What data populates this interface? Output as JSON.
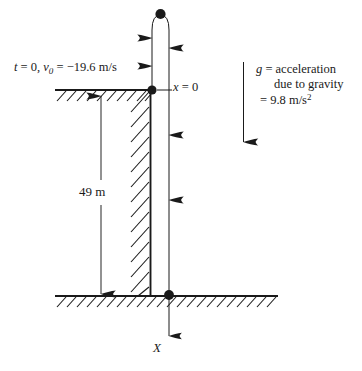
{
  "figure": {
    "background_color": "#ffffff",
    "ink_color": "#1a1a1a",
    "labels": {
      "initial_conditions": "t = 0, v₀ = −19.6 m/s",
      "initial_time_symbol": "t",
      "initial_time_value": "0",
      "initial_velocity_symbol": "v₀",
      "initial_velocity_value": "−19.6 m/s",
      "origin": "x = 0",
      "origin_symbol": "x",
      "origin_value": "0",
      "height": "49 m",
      "height_value": "49",
      "height_unit": "m",
      "axis": "X",
      "gravity_line_1": "g = acceleration",
      "gravity_line_2": "due to gravity",
      "gravity_line_3": "= 9.8 m/s²",
      "gravity_symbol": "g",
      "gravity_value": "9.8 m/s²"
    },
    "elements": {
      "apex_dot": "particle at highest point",
      "origin_dot": "particle at origin x = 0",
      "ground_dot": "particle at ground impact",
      "cliff_top": "hatched cliff top surface",
      "cliff_wall": "hatched vertical cliff face",
      "ground": "hatched ground surface",
      "up_arrows": "upward motion arrows",
      "down_arrows": "downward motion arrows",
      "gravity_arrow": "downward gravity vector arrow",
      "dimension_line": "double headed 49 m dimension line"
    }
  }
}
